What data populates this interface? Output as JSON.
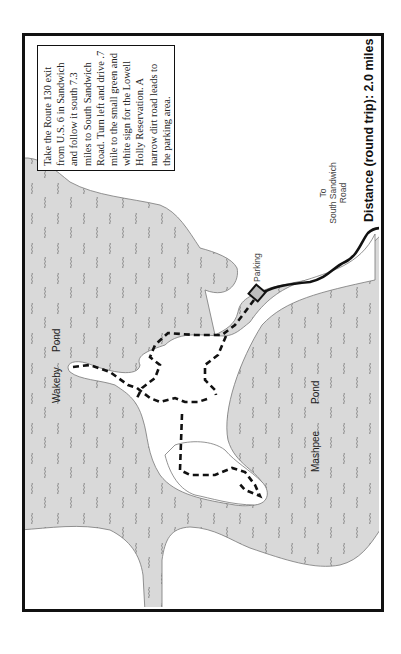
{
  "map": {
    "directions": "Take the Route 130 exit from U.S. 6 in Sandwich and follow it south 7.3 miles to South Sandwich Road. Turn left and drive .7 mile to the small green and white sign for the Lowell Holly Reservation. A narrow dirt road leads to the parking area.",
    "labels": {
      "wakeby": "Wakeby",
      "wakeby_pond": "Pond",
      "mashpee": "Mashpee",
      "mashpee_pond": "Pond",
      "parking": "Parking",
      "to_road_line1": "To",
      "to_road_line2": "South Sandwich",
      "to_road_line3": "Road",
      "distance": "Distance (round trip): 2.0 miles"
    },
    "colors": {
      "water": "#d9d9d9",
      "land": "#ffffff",
      "trail": "#111111",
      "frame": "#111111"
    },
    "legend_icons": [
      "parking-square-icon",
      "trail-dashed-line",
      "road-solid-line",
      "water-wave-icon"
    ]
  }
}
